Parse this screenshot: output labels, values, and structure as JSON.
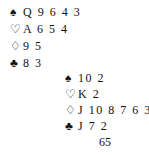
{
  "hands": [
    {
      "suits": [
        {
          "icon": "spade-icon",
          "glyph": "♠",
          "cards": "Q 9 6 4 3"
        },
        {
          "icon": "heart-icon",
          "glyph": "♡",
          "cards": "A 6 5 4"
        },
        {
          "icon": "diamond-icon",
          "glyph": "♢",
          "cards": "9 5"
        },
        {
          "icon": "club-icon",
          "glyph": "♣",
          "cards": "8 3"
        }
      ]
    },
    {
      "suits": [
        {
          "icon": "spade-icon",
          "glyph": "♠",
          "cards": "10 2"
        },
        {
          "icon": "heart-icon",
          "glyph": "♡",
          "cards": "K 2"
        },
        {
          "icon": "diamond-icon",
          "glyph": "♢",
          "cards": "J 10 8 7 6 3"
        },
        {
          "icon": "club-icon",
          "glyph": "♣",
          "cards": "J 7 2"
        }
      ]
    }
  ],
  "footnote": "65"
}
